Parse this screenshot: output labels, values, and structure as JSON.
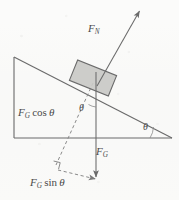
{
  "figure": {
    "type": "free-body-diagram",
    "background_color": "#fbfbfa",
    "ink_color": "#5a5a5a",
    "block_fill_color": "#c9c9c6",
    "block_stroke_color": "#6a6a6a"
  },
  "labels": {
    "normal_force": {
      "base": "F",
      "sub": "N",
      "full": "F_N"
    },
    "gravity": {
      "base": "F",
      "sub": "G",
      "full": "F_G"
    },
    "gravity_cos": {
      "base": "F",
      "sub": "G",
      "operator": "cos",
      "angle": "θ",
      "full": "F_G cos θ"
    },
    "gravity_sin": {
      "base": "F",
      "sub": "G",
      "operator": "sin",
      "angle": "θ",
      "full": "F_G sin θ"
    },
    "theta_block": "θ",
    "theta_base": "θ"
  },
  "geometry": {
    "incline": {
      "apex": [
        14,
        57
      ],
      "base_left": [
        14,
        138
      ],
      "base_right": [
        172,
        138
      ],
      "angle_degrees": 22
    },
    "block": {
      "center": [
        93,
        78
      ],
      "width": 42,
      "height": 22,
      "rotation_degrees": 22
    },
    "vectors": [
      {
        "name": "F_N",
        "from": [
          97,
          86
        ],
        "to": [
          141,
          8
        ],
        "style": "solid",
        "arrow": "end"
      },
      {
        "name": "F_G",
        "from": [
          96,
          84
        ],
        "to": [
          96,
          180
        ],
        "style": "solid",
        "arrow": "end"
      },
      {
        "name": "F_G cos theta",
        "from": [
          93,
          83
        ],
        "to": [
          55,
          166
        ],
        "style": "dashed",
        "arrow": "none"
      },
      {
        "name": "F_G sin theta",
        "from": [
          58,
          170
        ],
        "to": [
          97,
          180
        ],
        "style": "dashed",
        "arrow": "end"
      }
    ],
    "right_angle_marker": {
      "at": [
        57,
        164
      ],
      "size": 7
    }
  }
}
